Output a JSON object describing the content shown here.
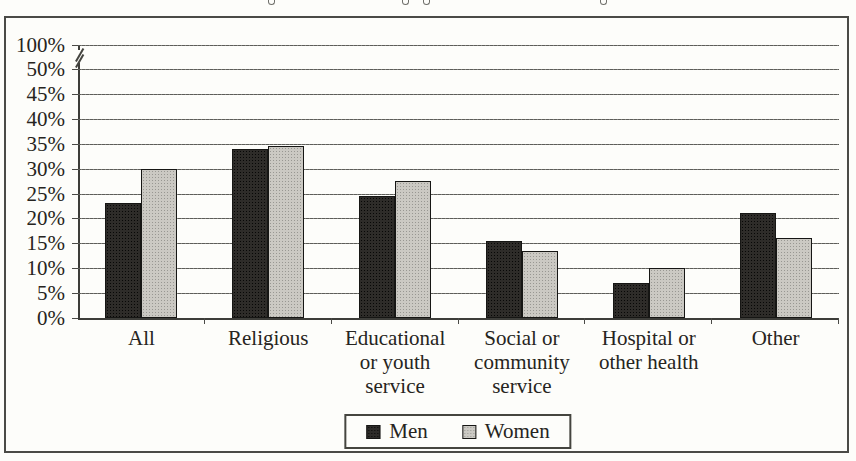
{
  "chart_data": {
    "type": "bar",
    "title": "",
    "xlabel": "",
    "ylabel": "",
    "grid": true,
    "axis_break": {
      "between": [
        "100%",
        "50%"
      ]
    },
    "y_axis": {
      "ticks": [
        {
          "label": "100%",
          "value": 100
        },
        {
          "label": "50%",
          "value": 50
        },
        {
          "label": "45%",
          "value": 45
        },
        {
          "label": "40%",
          "value": 40
        },
        {
          "label": "35%",
          "value": 35
        },
        {
          "label": "30%",
          "value": 30
        },
        {
          "label": "25%",
          "value": 25
        },
        {
          "label": "20%",
          "value": 20
        },
        {
          "label": "15%",
          "value": 15
        },
        {
          "label": "10%",
          "value": 10
        },
        {
          "label": "5%",
          "value": 5
        },
        {
          "label": "0%",
          "value": 0
        }
      ],
      "ylim_displayed": [
        0,
        50
      ]
    },
    "categories": [
      {
        "label": "All",
        "lines": [
          "All"
        ]
      },
      {
        "label": "Religious",
        "lines": [
          "Religious"
        ]
      },
      {
        "label": "Educational or youth service",
        "lines": [
          "Educational",
          "or youth",
          "service"
        ]
      },
      {
        "label": "Social or community service",
        "lines": [
          "Social or",
          "community",
          "service"
        ]
      },
      {
        "label": "Hospital or other health",
        "lines": [
          "Hospital or",
          "other health"
        ]
      },
      {
        "label": "Other",
        "lines": [
          "Other"
        ]
      }
    ],
    "series": [
      {
        "name": "Men",
        "color": "#2e2c29",
        "values": [
          23,
          34,
          24.5,
          15.5,
          7,
          21
        ]
      },
      {
        "name": "Women",
        "color": "#cbc9c3",
        "values": [
          30,
          34.5,
          27.5,
          13.5,
          10,
          16
        ]
      }
    ],
    "legend": {
      "position": "bottom-center",
      "items": [
        {
          "label": "Men",
          "color": "#2e2c29"
        },
        {
          "label": "Women",
          "color": "#cbc9c3"
        }
      ]
    }
  }
}
